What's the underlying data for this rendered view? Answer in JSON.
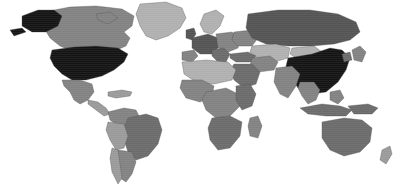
{
  "figure": {
    "kind": "world-choropleth-map",
    "projection": "equirectangular",
    "width": 410,
    "height": 192,
    "ocean_color": "#ffffff",
    "border_color": "#4a4a4a",
    "has_title": false,
    "has_legend": false,
    "has_axes": false,
    "has_labels": false,
    "includes_antarctica": false
  },
  "palette": {
    "black": "#141414",
    "very_dark": "#2b2b2b",
    "dark": "#545454",
    "mid_dark": "#6b6b6b",
    "mid": "#828282",
    "mid_light": "#9a9a9a",
    "light": "#b0b0b0",
    "very_light": "#c4c4c4",
    "ocean": "#ffffff"
  },
  "chart_data": {
    "type": "heatmap",
    "title": "",
    "subtitle": "",
    "xlabel": "",
    "ylabel": "",
    "legend_position": "none",
    "grid": false,
    "colorscale": "grayscale-dark-is-high",
    "regions": [
      {
        "name": "United States",
        "shade": "black",
        "color": "#141414"
      },
      {
        "name": "Alaska",
        "shade": "black",
        "color": "#141414"
      },
      {
        "name": "China",
        "shade": "black",
        "color": "#141414"
      },
      {
        "name": "Russia",
        "shade": "dark",
        "color": "#545454"
      },
      {
        "name": "Brazil",
        "shade": "mid_dark",
        "color": "#6b6b6b"
      },
      {
        "name": "Canada",
        "shade": "mid",
        "color": "#828282"
      },
      {
        "name": "Mexico",
        "shade": "mid",
        "color": "#828282"
      },
      {
        "name": "Australia",
        "shade": "mid_dark",
        "color": "#6b6b6b"
      },
      {
        "name": "India",
        "shade": "mid",
        "color": "#828282"
      },
      {
        "name": "Greenland",
        "shade": "light",
        "color": "#b0b0b0"
      },
      {
        "name": "United Kingdom",
        "shade": "dark",
        "color": "#545454"
      },
      {
        "name": "France",
        "shade": "dark",
        "color": "#545454"
      },
      {
        "name": "Germany",
        "shade": "dark",
        "color": "#545454"
      },
      {
        "name": "Spain",
        "shade": "mid",
        "color": "#828282"
      },
      {
        "name": "Italy",
        "shade": "mid_dark",
        "color": "#6b6b6b"
      },
      {
        "name": "Scandinavia",
        "shade": "light",
        "color": "#b0b0b0"
      },
      {
        "name": "Poland",
        "shade": "mid",
        "color": "#828282"
      },
      {
        "name": "Ukraine",
        "shade": "mid",
        "color": "#828282"
      },
      {
        "name": "Turkey",
        "shade": "mid_dark",
        "color": "#6b6b6b"
      },
      {
        "name": "Saudi Arabia",
        "shade": "mid_dark",
        "color": "#6b6b6b"
      },
      {
        "name": "Iran",
        "shade": "mid",
        "color": "#828282"
      },
      {
        "name": "Kazakhstan",
        "shade": "light",
        "color": "#b0b0b0"
      },
      {
        "name": "Mongolia",
        "shade": "light",
        "color": "#b0b0b0"
      },
      {
        "name": "Japan",
        "shade": "mid",
        "color": "#828282"
      },
      {
        "name": "Indonesia",
        "shade": "mid_dark",
        "color": "#6b6b6b"
      },
      {
        "name": "Sahara / North Africa",
        "shade": "light",
        "color": "#b0b0b0"
      },
      {
        "name": "Central Africa",
        "shade": "mid",
        "color": "#828282"
      },
      {
        "name": "South Africa",
        "shade": "mid_dark",
        "color": "#6b6b6b"
      },
      {
        "name": "Argentina",
        "shade": "mid",
        "color": "#828282"
      },
      {
        "name": "Chile",
        "shade": "mid_light",
        "color": "#9a9a9a"
      }
    ]
  },
  "geometry": {
    "viewbox": "0 0 410 192",
    "shapes": [
      {
        "id": "greenland",
        "name": "Greenland",
        "shade": "light",
        "d": "M140 4 L166 2 L182 8 L186 18 L180 28 L168 36 L156 40 L146 36 L140 26 L136 14 Z"
      },
      {
        "id": "canada",
        "name": "Canada",
        "shade": "mid",
        "d": "M44 12 L70 7 L96 6 L122 9 L134 16 L132 26 L124 32 L130 38 L126 46 L112 52 L92 54 L74 52 L60 46 L50 38 L44 28 Z M96 14 L110 12 L118 18 L108 24 L98 20 Z"
      },
      {
        "id": "alaska",
        "name": "Alaska",
        "shade": "black",
        "d": "M22 16 L38 10 L54 10 L62 16 L58 26 L46 32 L32 32 L22 26 Z M10 30 L22 28 L26 32 L14 36 Z"
      },
      {
        "id": "usa",
        "name": "United States",
        "shade": "black",
        "d": "M52 50 L74 47 L96 46 L118 48 L128 54 L124 62 L114 70 L102 76 L86 80 L72 80 L62 74 L54 66 L50 58 Z"
      },
      {
        "id": "mexico",
        "name": "Mexico",
        "shade": "mid",
        "d": "M62 80 L80 80 L92 84 L94 92 L88 100 L80 104 L74 100 L70 92 L64 86 Z"
      },
      {
        "id": "centralamerica",
        "name": "Central America",
        "shade": "mid_light",
        "d": "M88 100 L98 102 L106 108 L110 114 L104 116 L96 110 L88 104 Z"
      },
      {
        "id": "caribbean",
        "name": "Caribbean",
        "shade": "mid_light",
        "d": "M108 92 L122 90 L132 92 L130 96 L116 98 L108 96 Z"
      },
      {
        "id": "colombia",
        "name": "Colombia / Venezuela",
        "shade": "mid",
        "d": "M108 112 L124 108 L136 110 L140 118 L132 126 L118 126 L110 120 Z"
      },
      {
        "id": "brazil",
        "name": "Brazil",
        "shade": "mid_dark",
        "d": "M128 118 L146 114 L158 118 L162 130 L158 144 L148 156 L136 160 L128 152 L124 140 L124 128 Z"
      },
      {
        "id": "peru",
        "name": "Peru / Bolivia",
        "shade": "mid_light",
        "d": "M108 122 L124 124 L128 136 L124 148 L116 150 L110 140 L106 130 Z"
      },
      {
        "id": "argentina",
        "name": "Argentina",
        "shade": "mid",
        "d": "M118 150 L132 152 L136 162 L132 174 L126 182 L120 178 L116 166 Z"
      },
      {
        "id": "chile",
        "name": "Chile",
        "shade": "mid_light",
        "d": "M112 148 L118 150 L120 164 L122 178 L118 184 L112 172 L110 158 Z"
      },
      {
        "id": "uk",
        "name": "United Kingdom / Ireland",
        "shade": "dark",
        "d": "M186 30 L194 28 L196 34 L192 40 L186 38 Z"
      },
      {
        "id": "scandinavia",
        "name": "Scandinavia",
        "shade": "light",
        "d": "M204 14 L216 10 L224 16 L220 26 L212 34 L204 32 L200 24 Z"
      },
      {
        "id": "iberia",
        "name": "Iberia",
        "shade": "mid",
        "d": "M182 52 L194 50 L198 56 L192 62 L182 60 Z"
      },
      {
        "id": "westeurope",
        "name": "Western Europe",
        "shade": "dark",
        "d": "M192 38 L208 34 L218 38 L220 46 L212 54 L200 54 L192 48 Z"
      },
      {
        "id": "centraleurope",
        "name": "Central Europe",
        "shade": "mid",
        "d": "M216 34 L232 32 L240 38 L238 48 L228 52 L218 48 Z"
      },
      {
        "id": "italy",
        "name": "Italy / Balkans",
        "shade": "mid_dark",
        "d": "M212 50 L224 48 L230 54 L226 62 L218 62 L212 56 Z"
      },
      {
        "id": "ukraine",
        "name": "Ukraine / Belarus",
        "shade": "mid",
        "d": "M234 32 L252 30 L258 38 L252 46 L238 46 L232 40 Z"
      },
      {
        "id": "russia",
        "name": "Russia",
        "shade": "dark",
        "d": "M248 14 L278 10 L310 10 L338 14 L356 22 L360 32 L350 40 L334 44 L312 46 L288 46 L266 44 L252 38 L246 28 Z"
      },
      {
        "id": "kazakhstan",
        "name": "Kazakhstan / Central Asia",
        "shade": "light",
        "d": "M252 46 L276 44 L290 48 L288 58 L274 62 L258 58 L250 52 Z"
      },
      {
        "id": "mongolia",
        "name": "Mongolia",
        "shade": "light",
        "d": "M292 48 L314 46 L322 52 L314 58 L296 58 L290 54 Z"
      },
      {
        "id": "china",
        "name": "China",
        "shade": "black",
        "d": "M288 58 L312 54 L330 48 L342 50 L350 58 L346 70 L338 82 L326 92 L312 94 L298 88 L290 76 L286 66 Z"
      },
      {
        "id": "turkey",
        "name": "Turkey / Caucasus",
        "shade": "mid_dark",
        "d": "M230 54 L248 52 L256 56 L252 62 L236 62 L230 58 Z"
      },
      {
        "id": "iran",
        "name": "Iran",
        "shade": "mid",
        "d": "M252 58 L270 56 L278 62 L274 70 L258 72 L250 66 Z"
      },
      {
        "id": "arabia",
        "name": "Saudi Arabia",
        "shade": "mid_dark",
        "d": "M234 64 L252 64 L260 72 L256 84 L244 88 L234 80 L230 70 Z"
      },
      {
        "id": "india",
        "name": "India",
        "shade": "mid",
        "d": "M276 68 L292 66 L300 74 L296 86 L288 98 L280 94 L274 82 Z"
      },
      {
        "id": "seasia",
        "name": "Southeast Asia",
        "shade": "mid",
        "d": "M300 82 L314 82 L320 90 L316 100 L308 104 L302 96 L298 88 Z"
      },
      {
        "id": "indonesia",
        "name": "Indonesia",
        "shade": "mid_dark",
        "d": "M300 108 L322 104 L340 106 L352 110 L346 116 L326 116 L308 114 Z"
      },
      {
        "id": "philippines",
        "name": "Philippines",
        "shade": "mid",
        "d": "M330 92 L340 90 L344 98 L338 104 L330 100 Z"
      },
      {
        "id": "japan",
        "name": "Japan",
        "shade": "mid",
        "d": "M352 50 L360 46 L366 52 L362 62 L354 60 Z"
      },
      {
        "id": "korea",
        "name": "Korea",
        "shade": "mid_dark",
        "d": "M342 54 L350 52 L352 60 L344 62 Z"
      },
      {
        "id": "newguinea",
        "name": "New Guinea",
        "shade": "mid_dark",
        "d": "M348 106 L368 104 L378 108 L372 114 L354 114 Z"
      },
      {
        "id": "australia",
        "name": "Australia",
        "shade": "mid_dark",
        "d": "M322 122 L344 118 L362 120 L372 128 L370 142 L360 152 L344 156 L330 150 L322 138 Z"
      },
      {
        "id": "newzealand",
        "name": "New Zealand",
        "shade": "mid_light",
        "d": "M382 150 L390 146 L392 154 L386 164 L380 160 Z"
      },
      {
        "id": "northafrica",
        "name": "North Africa / Sahara",
        "shade": "light",
        "d": "M182 62 L206 60 L228 62 L236 70 L232 80 L214 84 L196 82 L184 74 Z"
      },
      {
        "id": "westafrica",
        "name": "West Africa",
        "shade": "mid",
        "d": "M182 80 L202 80 L214 86 L212 96 L200 102 L186 98 L180 88 Z"
      },
      {
        "id": "centralafrica",
        "name": "Central Africa",
        "shade": "mid",
        "d": "M206 92 L226 88 L238 94 L240 106 L230 116 L216 118 L206 110 L202 100 Z"
      },
      {
        "id": "eastafrica",
        "name": "East Africa",
        "shade": "mid_dark",
        "d": "M236 86 L250 84 L256 94 L252 106 L242 110 L236 100 Z"
      },
      {
        "id": "southafrica",
        "name": "Southern Africa",
        "shade": "mid_dark",
        "d": "M212 118 L230 116 L242 122 L240 136 L230 148 L218 150 L210 140 L208 128 Z"
      },
      {
        "id": "madagascar",
        "name": "Madagascar",
        "shade": "mid",
        "d": "M250 118 L258 116 L262 126 L258 138 L250 136 L248 126 Z"
      }
    ]
  }
}
